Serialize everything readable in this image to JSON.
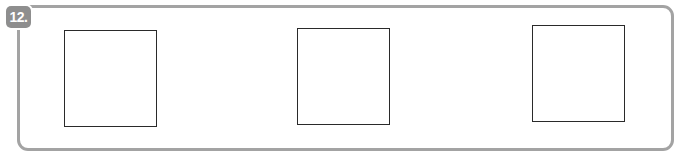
{
  "question": {
    "number_label": "12.",
    "answer_boxes": [
      {
        "id": 1,
        "content": ""
      },
      {
        "id": 2,
        "content": ""
      },
      {
        "id": 3,
        "content": ""
      }
    ]
  },
  "colors": {
    "frame_border": "#a3a3a3",
    "badge_background": "#8e8e8e",
    "badge_text": "#ffffff",
    "box_border": "#2a2a2a"
  }
}
